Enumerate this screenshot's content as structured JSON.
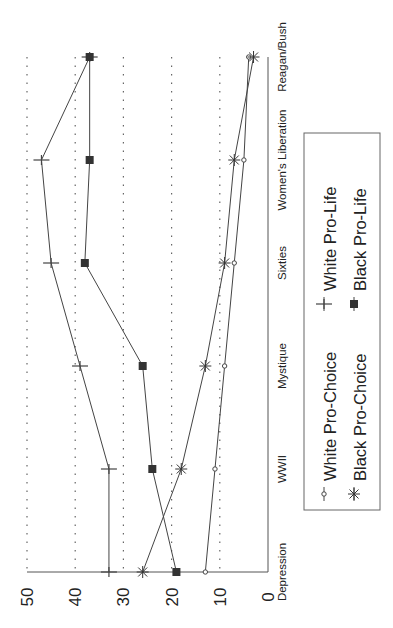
{
  "chart_data": {
    "type": "line",
    "orientation": "rotated-90-ccw",
    "title": "",
    "xlabel": "",
    "ylabel": "",
    "categories": [
      "Depression",
      "WWII",
      "Mystique",
      "Sixties",
      "Women's Liberation",
      "Reagan/Bush"
    ],
    "ylim": [
      0,
      50
    ],
    "yticks": [
      0,
      10,
      20,
      30,
      40,
      50
    ],
    "grid": "dotted horizontal at 10,20,30,40,50",
    "legend_position": "right",
    "series": [
      {
        "name": "White Pro-Choice",
        "marker": "open-circle",
        "values": [
          13,
          11,
          9,
          7,
          5,
          4
        ]
      },
      {
        "name": "White Pro-Life",
        "marker": "plus",
        "values": [
          33,
          33,
          39,
          45,
          47,
          37
        ]
      },
      {
        "name": "Black Pro-Choice",
        "marker": "asterisk",
        "values": [
          26,
          18,
          13,
          9,
          7,
          3
        ]
      },
      {
        "name": "Black Pro-Life",
        "marker": "filled-square",
        "values": [
          19,
          24,
          26,
          38,
          37,
          37
        ]
      }
    ]
  }
}
